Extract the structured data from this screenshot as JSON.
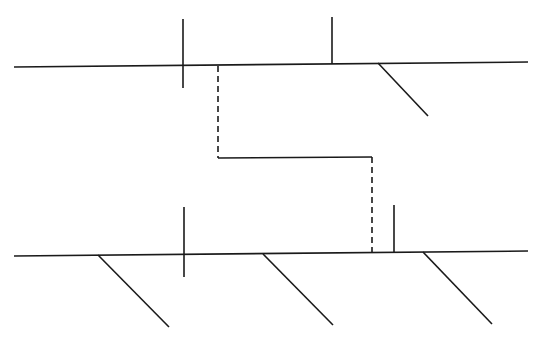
{
  "diagram": {
    "width": 543,
    "height": 348,
    "background": "#ffffff",
    "stroke_color": "#1a1a1a",
    "stroke_width": 1.6,
    "top_line": {
      "x1": 14,
      "y1": 67,
      "x2": 528,
      "y2": 62
    },
    "top_cross": {
      "x1": 183,
      "y1": 19,
      "x2": 183,
      "y2": 88
    },
    "top_tick": {
      "x1": 332,
      "y1": 17,
      "x2": 332,
      "y2": 64
    },
    "top_diagonal": {
      "x1": 378,
      "y1": 63,
      "x2": 428,
      "y2": 116
    },
    "connector": {
      "dashed_left": {
        "x1": 218,
        "y1": 66,
        "x2": 218,
        "y2": 158
      },
      "solid_mid": {
        "x1": 218,
        "y1": 158,
        "x2": 372,
        "y2": 157
      },
      "dashed_right": {
        "x1": 372,
        "y1": 157,
        "x2": 372,
        "y2": 253
      }
    },
    "bottom_line": {
      "x1": 14,
      "y1": 256,
      "x2": 528,
      "y2": 251
    },
    "bottom_cross": {
      "x1": 184,
      "y1": 207,
      "x2": 184,
      "y2": 277
    },
    "bottom_tick": {
      "x1": 394,
      "y1": 205,
      "x2": 394,
      "y2": 252
    },
    "bottom_diagonals": [
      {
        "x1": 98,
        "y1": 255,
        "x2": 169,
        "y2": 327
      },
      {
        "x1": 263,
        "y1": 254,
        "x2": 333,
        "y2": 325
      },
      {
        "x1": 423,
        "y1": 252,
        "x2": 492,
        "y2": 324
      }
    ]
  }
}
